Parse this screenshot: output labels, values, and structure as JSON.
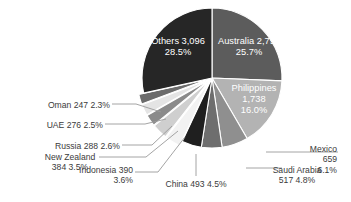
{
  "chart_data": {
    "type": "pie",
    "title": "",
    "subtitle": "",
    "xlabel": "",
    "ylabel": "",
    "legend_position": "none",
    "grid": false,
    "total": 10879,
    "value_unit": "",
    "start_angle_deg": 0,
    "direction": "clockwise",
    "categories": [
      "Australia",
      "Philippines",
      "Mexico",
      "Saudi Arabia",
      "China",
      "Indonesia",
      "New Zealand",
      "Russia",
      "UAE",
      "Oman",
      "Others"
    ],
    "values": [
      2791,
      1738,
      659,
      517,
      493,
      390,
      384,
      288,
      276,
      247,
      3096
    ],
    "percentages": [
      25.7,
      16.0,
      6.1,
      4.8,
      4.5,
      3.6,
      3.5,
      2.6,
      2.5,
      2.3,
      28.5
    ],
    "colors": [
      "#5c5c5c",
      "#b3b3b3",
      "#8f8f8f",
      "#6e6e6e",
      "#1f1f1f",
      "#f2f2f2",
      "#cfcfcf",
      "#8a8a8a",
      "#e4e4e4",
      "#6b6b6b",
      "#262626"
    ],
    "slices": [
      {
        "name": "Australia",
        "value": "2,791",
        "percent": "25.7%",
        "color": "#5c5c5c",
        "label_placement": "inside",
        "label_color": "#ffffff",
        "exploded": false,
        "label_line1": "Australia 2,791",
        "label_line2": "25.7%",
        "label_line3": "",
        "label_x": 249,
        "label_y": 47,
        "text_anchor": "middle"
      },
      {
        "name": "Philippines",
        "value": "1,738",
        "percent": "16.0%",
        "color": "#b3b3b3",
        "label_placement": "inside",
        "label_color": "#ffffff",
        "exploded": false,
        "label_line1": "Philippines",
        "label_line2": "1,738",
        "label_line3": "16.0%",
        "label_x": 254,
        "label_y": 100,
        "text_anchor": "middle"
      },
      {
        "name": "Mexico",
        "value": "659",
        "percent": "6.1%",
        "color": "#8f8f8f",
        "label_placement": "outside",
        "label_color": "#3b3b3b",
        "exploded": false,
        "label_line1": "Mexico",
        "label_line2": "659",
        "label_line3": "6.1%",
        "label_x": 337,
        "label_y": 160,
        "text_anchor": "end"
      },
      {
        "name": "Saudi Arabia",
        "value": "517",
        "percent": "4.8%",
        "color": "#6e6e6e",
        "label_placement": "outside",
        "label_color": "#3b3b3b",
        "exploded": false,
        "label_line1": "Saudi Arabia",
        "label_line2": "517  4.8%",
        "label_line3": "",
        "label_x": 297,
        "label_y": 176,
        "text_anchor": "middle"
      },
      {
        "name": "China",
        "value": "493",
        "percent": "4.5%",
        "color": "#1f1f1f",
        "label_placement": "outside",
        "label_color": "#3b3b3b",
        "exploded": false,
        "label_line1": "China 493  4.5%",
        "label_line2": "",
        "label_line3": "",
        "label_x": 196,
        "label_y": 185,
        "text_anchor": "middle"
      },
      {
        "name": "Indonesia",
        "value": "390",
        "percent": "3.6%",
        "color": "#f2f2f2",
        "label_placement": "outside",
        "label_color": "#3b3b3b",
        "exploded": true,
        "label_line1": "Indonesia 390",
        "label_line2": "3.6%",
        "label_line3": "",
        "label_x": 133,
        "label_y": 176,
        "text_anchor": "end"
      },
      {
        "name": "New Zealand",
        "value": "384",
        "percent": "3.5%",
        "color": "#cfcfcf",
        "label_placement": "outside",
        "label_color": "#3b3b3b",
        "exploded": true,
        "label_line1": "New Zealand",
        "label_line2": "384  3.5%",
        "label_line3": "",
        "label_x": 70,
        "label_y": 163,
        "text_anchor": "middle"
      },
      {
        "name": "Russia",
        "value": "288",
        "percent": "2.6%",
        "color": "#8a8a8a",
        "label_placement": "outside",
        "label_color": "#3b3b3b",
        "exploded": true,
        "label_line1": "Russia 288  2.6%",
        "label_line2": "",
        "label_line3": "",
        "label_x": 120,
        "label_y": 147,
        "text_anchor": "end"
      },
      {
        "name": "UAE",
        "value": "276",
        "percent": "2.5%",
        "color": "#e4e4e4",
        "label_placement": "outside",
        "label_color": "#3b3b3b",
        "exploded": true,
        "label_line1": "UAE 276  2.5%",
        "label_line2": "",
        "label_line3": "",
        "label_x": 103,
        "label_y": 126,
        "text_anchor": "end"
      },
      {
        "name": "Oman",
        "value": "247",
        "percent": "2.3%",
        "color": "#6b6b6b",
        "label_placement": "outside",
        "label_color": "#3b3b3b",
        "exploded": true,
        "label_line1": "Oman 247  2.3%",
        "label_line2": "",
        "label_line3": "",
        "label_x": 110,
        "label_y": 106,
        "text_anchor": "end"
      },
      {
        "name": "Others",
        "value": "3,096",
        "percent": "28.5%",
        "color": "#262626",
        "label_placement": "inside",
        "label_color": "#ffffff",
        "exploded": false,
        "label_line1": "Others 3,096",
        "label_line2": "28.5%",
        "label_line3": "",
        "label_x": 178,
        "label_y": 47,
        "text_anchor": "middle"
      }
    ],
    "geometry": {
      "center_x": 212,
      "center_y": 78,
      "radius": 70,
      "explode_offset": 5
    },
    "leader_lines": [
      {
        "name": "oman-leader",
        "points": "112,104 136,104 161,112"
      },
      {
        "name": "uae-leader",
        "points": "105,124 145,124 166,119"
      },
      {
        "name": "russia-leader",
        "points": "122,145 152,145 172,126"
      },
      {
        "name": "newzealand-leader",
        "points": "99,157 146,157 178,131"
      },
      {
        "name": "indonesia-leader",
        "points": "135,172 158,172 185,137"
      },
      {
        "name": "china-leader",
        "points": "196,176 196,154"
      },
      {
        "name": "saudi-leader",
        "points": "246,168 262,168 282,168"
      },
      {
        "name": "mexico-leader",
        "points": "266,152 300,152 338,152"
      }
    ]
  }
}
